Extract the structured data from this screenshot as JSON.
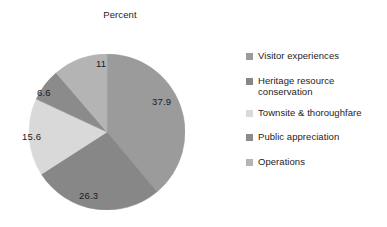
{
  "chart": {
    "title": "Percent"
  },
  "chart_data": {
    "type": "pie",
    "title": "Percent",
    "xlabel": "",
    "ylabel": "",
    "legend_position": "right",
    "grid": false,
    "start_angle_deg": 0,
    "direction": "clockwise",
    "categories": [
      "Visitor experiences",
      "Heritage resource conservation",
      "Townsite & thoroughfare",
      "Public appreciation",
      "Operations"
    ],
    "values": [
      37.9,
      26.3,
      15.6,
      6.6,
      11
    ],
    "value_labels": [
      "37.9",
      "26.3",
      "15.6",
      "6.6",
      "11"
    ],
    "colors": [
      "#9b9b9b",
      "#878787",
      "#d9d9d9",
      "#8b8b8b",
      "#b4b4b4"
    ],
    "slices": [
      {
        "label": "Visitor experiences",
        "value": 37.9,
        "value_label": "37.9",
        "color": "#9b9b9b",
        "label_left": "152px",
        "label_top": "96px"
      },
      {
        "label": "Heritage resource conservation",
        "value": 26.3,
        "value_label": "26.3",
        "color": "#878787",
        "label_left": "79px",
        "label_top": "190px"
      },
      {
        "label": "Townsite & thoroughfare",
        "value": 15.6,
        "value_label": "15.6",
        "color": "#d9d9d9",
        "label_left": "22px",
        "label_top": "131px"
      },
      {
        "label": "Public appreciation",
        "value": 6.6,
        "value_label": "6.6",
        "color": "#8b8b8b",
        "label_left": "37px",
        "label_top": "87px"
      },
      {
        "label": "Operations",
        "value": 11,
        "value_label": "11",
        "color": "#b4b4b4",
        "label_left": "96px",
        "label_top": "58px"
      }
    ]
  },
  "legend": {
    "items": [
      {
        "label": "Visitor experiences",
        "color": "#9b9b9b"
      },
      {
        "label": "Heritage resource conservation",
        "color": "#878787"
      },
      {
        "label": "Townsite & thoroughfare",
        "color": "#d9d9d9"
      },
      {
        "label": "Public appreciation",
        "color": "#8b8b8b"
      },
      {
        "label": "Operations",
        "color": "#b4b4b4"
      }
    ]
  }
}
